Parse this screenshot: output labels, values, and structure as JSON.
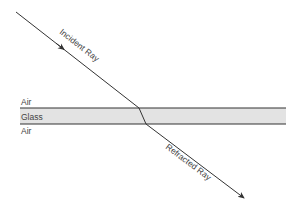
{
  "diagram": {
    "type": "refraction-through-glass-slab",
    "media": {
      "top": "Air",
      "middle": "Glass",
      "bottom": "Air"
    },
    "rays": {
      "incident": "Incident Ray",
      "refracted": "Refracted Ray"
    },
    "colors": {
      "glass_fill": "#e3e3e3",
      "boundary": "#333333",
      "ray": "#333333",
      "text": "#444444"
    }
  }
}
